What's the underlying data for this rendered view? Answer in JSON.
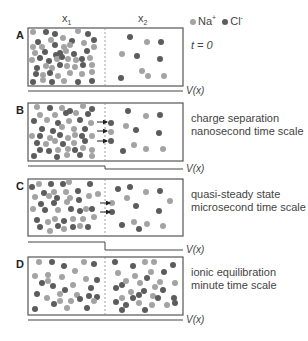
{
  "header": {
    "x1": "x",
    "x1_sub": "1",
    "x2": "x",
    "x2_sub": "2"
  },
  "legend": {
    "na_label": "Na",
    "na_sup": "+",
    "cl_label": "Cl",
    "cl_sup": "-",
    "na_color": "#a3a3a3",
    "cl_color": "#5c5c5c"
  },
  "vx_label": "V(x)",
  "panels": [
    {
      "letter": "A",
      "top": 28,
      "bottom": 86,
      "caption": [
        "t = 0"
      ],
      "caption_italic": true,
      "v_left_y": 91,
      "v_right_y": 91,
      "arrows": [],
      "dots": [
        [
          33,
          32,
          "n"
        ],
        [
          46,
          32,
          "c"
        ],
        [
          55,
          34,
          "c"
        ],
        [
          78,
          31,
          "n"
        ],
        [
          88,
          34,
          "c"
        ],
        [
          38,
          42,
          "c"
        ],
        [
          51,
          40,
          "n"
        ],
        [
          63,
          38,
          "n"
        ],
        [
          72,
          41,
          "c"
        ],
        [
          84,
          43,
          "n"
        ],
        [
          94,
          40,
          "c"
        ],
        [
          33,
          47,
          "n"
        ],
        [
          42,
          47,
          "n"
        ],
        [
          55,
          45,
          "c"
        ],
        [
          64,
          47,
          "n"
        ],
        [
          70,
          45,
          "n"
        ],
        [
          94,
          47,
          "n"
        ],
        [
          35,
          53,
          "n"
        ],
        [
          45,
          52,
          "c"
        ],
        [
          56,
          55,
          "c"
        ],
        [
          60,
          53,
          "c"
        ],
        [
          66,
          51,
          "n"
        ],
        [
          74,
          54,
          "c"
        ],
        [
          87,
          51,
          "c"
        ],
        [
          32,
          60,
          "n"
        ],
        [
          40,
          58,
          "c"
        ],
        [
          49,
          61,
          "c"
        ],
        [
          57,
          59,
          "n"
        ],
        [
          62,
          57,
          "c"
        ],
        [
          68,
          59,
          "n"
        ],
        [
          76,
          60,
          "n"
        ],
        [
          82,
          59,
          "c"
        ],
        [
          90,
          58,
          "n"
        ],
        [
          37,
          68,
          "c"
        ],
        [
          46,
          66,
          "n"
        ],
        [
          52,
          68,
          "n"
        ],
        [
          60,
          65,
          "c"
        ],
        [
          67,
          66,
          "n"
        ],
        [
          75,
          67,
          "n"
        ],
        [
          83,
          65,
          "c"
        ],
        [
          92,
          65,
          "n"
        ],
        [
          36,
          74,
          "c"
        ],
        [
          43,
          75,
          "n"
        ],
        [
          50,
          73,
          "c"
        ],
        [
          58,
          76,
          "n"
        ],
        [
          70,
          73,
          "n"
        ],
        [
          82,
          74,
          "n"
        ],
        [
          92,
          72,
          "n"
        ],
        [
          33,
          82,
          "c"
        ],
        [
          43,
          80,
          "n"
        ],
        [
          52,
          82,
          "c"
        ],
        [
          64,
          81,
          "n"
        ],
        [
          78,
          82,
          "c"
        ],
        [
          92,
          81,
          "c"
        ],
        [
          130,
          37,
          "c"
        ],
        [
          147,
          42,
          "n"
        ],
        [
          161,
          42,
          "c"
        ],
        [
          122,
          54,
          "n"
        ],
        [
          137,
          56,
          "c"
        ],
        [
          160,
          59,
          "c"
        ],
        [
          142,
          71,
          "n"
        ],
        [
          148,
          76,
          "n"
        ],
        [
          164,
          76,
          "n"
        ],
        [
          121,
          78,
          "c"
        ]
      ]
    },
    {
      "letter": "B",
      "top": 103,
      "bottom": 161,
      "caption": [
        "charge separation",
        "nanosecond time scale"
      ],
      "caption_italic": false,
      "v_left_y": 166,
      "v_right_y": 169,
      "arrows": [
        [
          97,
          122
        ],
        [
          97,
          131
        ],
        [
          97,
          141
        ]
      ],
      "dots": [
        [
          37,
          107,
          "n"
        ],
        [
          50,
          108,
          "c"
        ],
        [
          62,
          108,
          "n"
        ],
        [
          70,
          111,
          "c"
        ],
        [
          83,
          106,
          "n"
        ],
        [
          92,
          109,
          "c"
        ],
        [
          40,
          115,
          "n"
        ],
        [
          55,
          115,
          "n"
        ],
        [
          66,
          113,
          "c"
        ],
        [
          76,
          113,
          "n"
        ],
        [
          88,
          114,
          "c"
        ],
        [
          34,
          121,
          "c"
        ],
        [
          47,
          120,
          "n"
        ],
        [
          58,
          123,
          "c"
        ],
        [
          69,
          121,
          "n"
        ],
        [
          80,
          120,
          "c"
        ],
        [
          91,
          123,
          "n"
        ],
        [
          42,
          129,
          "c"
        ],
        [
          53,
          131,
          "c"
        ],
        [
          62,
          127,
          "n"
        ],
        [
          74,
          129,
          "n"
        ],
        [
          85,
          129,
          "c"
        ],
        [
          32,
          136,
          "n"
        ],
        [
          40,
          136,
          "c"
        ],
        [
          50,
          138,
          "n"
        ],
        [
          60,
          135,
          "c"
        ],
        [
          68,
          138,
          "n"
        ],
        [
          75,
          135,
          "n"
        ],
        [
          82,
          136,
          "c"
        ],
        [
          92,
          136,
          "n"
        ],
        [
          37,
          143,
          "c"
        ],
        [
          46,
          144,
          "n"
        ],
        [
          55,
          141,
          "n"
        ],
        [
          63,
          144,
          "c"
        ],
        [
          74,
          143,
          "n"
        ],
        [
          85,
          141,
          "c"
        ],
        [
          40,
          150,
          "c"
        ],
        [
          49,
          151,
          "c"
        ],
        [
          58,
          150,
          "n"
        ],
        [
          68,
          149,
          "n"
        ],
        [
          75,
          150,
          "c"
        ],
        [
          83,
          148,
          "n"
        ],
        [
          92,
          150,
          "n"
        ],
        [
          34,
          156,
          "c"
        ],
        [
          57,
          157,
          "c"
        ],
        [
          67,
          155,
          "n"
        ],
        [
          80,
          155,
          "c"
        ],
        [
          92,
          156,
          "n"
        ],
        [
          111,
          123,
          "c"
        ],
        [
          111,
          132,
          "n"
        ],
        [
          111,
          141,
          "c"
        ],
        [
          128,
          111,
          "c"
        ],
        [
          146,
          116,
          "n"
        ],
        [
          160,
          115,
          "c"
        ],
        [
          126,
          126,
          "n"
        ],
        [
          136,
          130,
          "c"
        ],
        [
          159,
          133,
          "c"
        ],
        [
          134,
          145,
          "n"
        ],
        [
          146,
          149,
          "n"
        ],
        [
          163,
          149,
          "n"
        ],
        [
          123,
          151,
          "c"
        ]
      ]
    },
    {
      "letter": "C",
      "top": 179,
      "bottom": 236,
      "caption": [
        "quasi-steady state",
        "microsecond time scale"
      ],
      "caption_italic": false,
      "v_left_y": 242,
      "v_right_y": 250,
      "arrows": [
        [
          100,
          203
        ],
        [
          100,
          212
        ]
      ],
      "dots": [
        [
          32,
          187,
          "c"
        ],
        [
          39,
          184,
          "n"
        ],
        [
          51,
          184,
          "c"
        ],
        [
          63,
          184,
          "c"
        ],
        [
          69,
          182,
          "n"
        ],
        [
          90,
          184,
          "c"
        ],
        [
          44,
          193,
          "c"
        ],
        [
          54,
          192,
          "n"
        ],
        [
          66,
          192,
          "n"
        ],
        [
          78,
          191,
          "c"
        ],
        [
          35,
          197,
          "n"
        ],
        [
          49,
          196,
          "n"
        ],
        [
          57,
          198,
          "c"
        ],
        [
          70,
          198,
          "n"
        ],
        [
          89,
          196,
          "n"
        ],
        [
          98,
          194,
          "n"
        ],
        [
          41,
          204,
          "c"
        ],
        [
          54,
          203,
          "c"
        ],
        [
          67,
          202,
          "n"
        ],
        [
          79,
          200,
          "c"
        ],
        [
          33,
          209,
          "n"
        ],
        [
          45,
          210,
          "c"
        ],
        [
          58,
          210,
          "n"
        ],
        [
          71,
          209,
          "c"
        ],
        [
          80,
          211,
          "c"
        ],
        [
          86,
          209,
          "n"
        ],
        [
          92,
          209,
          "c"
        ],
        [
          37,
          220,
          "c"
        ],
        [
          48,
          222,
          "n"
        ],
        [
          55,
          219,
          "n"
        ],
        [
          64,
          221,
          "c"
        ],
        [
          73,
          219,
          "n"
        ],
        [
          83,
          219,
          "n"
        ],
        [
          94,
          217,
          "n"
        ],
        [
          40,
          227,
          "c"
        ],
        [
          50,
          231,
          "n"
        ],
        [
          58,
          226,
          "c"
        ],
        [
          64,
          229,
          "n"
        ],
        [
          73,
          227,
          "c"
        ],
        [
          80,
          226,
          "n"
        ],
        [
          88,
          227,
          "c"
        ],
        [
          112,
          203,
          "n"
        ],
        [
          112,
          212,
          "c"
        ],
        [
          118,
          189,
          "c"
        ],
        [
          130,
          187,
          "c"
        ],
        [
          146,
          192,
          "n"
        ],
        [
          160,
          191,
          "c"
        ],
        [
          170,
          201,
          "n"
        ],
        [
          127,
          198,
          "n"
        ],
        [
          136,
          206,
          "c"
        ],
        [
          159,
          211,
          "c"
        ],
        [
          122,
          225,
          "c"
        ],
        [
          134,
          222,
          "n"
        ],
        [
          139,
          229,
          "c"
        ],
        [
          147,
          224,
          "n"
        ],
        [
          163,
          226,
          "n"
        ]
      ]
    },
    {
      "letter": "D",
      "top": 257,
      "bottom": 315,
      "caption": [
        "ionic equilibration",
        "minute time scale"
      ],
      "caption_italic": false,
      "v_left_y": 320,
      "v_right_y": 320,
      "arrows": [],
      "dots": [
        [
          39,
          262,
          "n"
        ],
        [
          52,
          262,
          "c"
        ],
        [
          64,
          266,
          "c"
        ],
        [
          84,
          262,
          "n"
        ],
        [
          94,
          264,
          "c"
        ],
        [
          35,
          276,
          "n"
        ],
        [
          48,
          275,
          "n"
        ],
        [
          62,
          277,
          "n"
        ],
        [
          75,
          271,
          "n"
        ],
        [
          86,
          279,
          "n"
        ],
        [
          97,
          280,
          "c"
        ],
        [
          42,
          283,
          "c"
        ],
        [
          53,
          286,
          "c"
        ],
        [
          73,
          285,
          "n"
        ],
        [
          91,
          288,
          "c"
        ],
        [
          65,
          290,
          "c"
        ],
        [
          48,
          281,
          "n"
        ],
        [
          37,
          294,
          "c"
        ],
        [
          47,
          298,
          "n"
        ],
        [
          60,
          294,
          "n"
        ],
        [
          77,
          295,
          "n"
        ],
        [
          89,
          296,
          "c"
        ],
        [
          97,
          297,
          "c"
        ],
        [
          54,
          304,
          "c"
        ],
        [
          60,
          301,
          "n"
        ],
        [
          71,
          301,
          "n"
        ],
        [
          80,
          299,
          "c"
        ],
        [
          94,
          301,
          "n"
        ],
        [
          35,
          309,
          "c"
        ],
        [
          67,
          308,
          "n"
        ],
        [
          87,
          308,
          "c"
        ],
        [
          115,
          262,
          "c"
        ],
        [
          133,
          266,
          "c"
        ],
        [
          145,
          262,
          "n"
        ],
        [
          154,
          262,
          "n"
        ],
        [
          173,
          265,
          "c"
        ],
        [
          118,
          273,
          "n"
        ],
        [
          135,
          276,
          "n"
        ],
        [
          151,
          272,
          "n"
        ],
        [
          164,
          272,
          "c"
        ],
        [
          122,
          285,
          "c"
        ],
        [
          126,
          281,
          "n"
        ],
        [
          140,
          283,
          "n"
        ],
        [
          147,
          278,
          "c"
        ],
        [
          155,
          287,
          "n"
        ],
        [
          160,
          282,
          "n"
        ],
        [
          175,
          283,
          "n"
        ],
        [
          116,
          288,
          "c"
        ],
        [
          131,
          292,
          "n"
        ],
        [
          139,
          295,
          "c"
        ],
        [
          144,
          291,
          "c"
        ],
        [
          163,
          290,
          "c"
        ],
        [
          122,
          298,
          "n"
        ],
        [
          133,
          298,
          "c"
        ],
        [
          153,
          296,
          "n"
        ],
        [
          158,
          298,
          "c"
        ],
        [
          174,
          298,
          "c"
        ],
        [
          116,
          302,
          "c"
        ],
        [
          126,
          305,
          "c"
        ],
        [
          139,
          303,
          "n"
        ],
        [
          152,
          305,
          "n"
        ],
        [
          167,
          305,
          "n"
        ],
        [
          175,
          303,
          "c"
        ],
        [
          122,
          310,
          "c"
        ],
        [
          145,
          310,
          "c"
        ]
      ]
    }
  ]
}
